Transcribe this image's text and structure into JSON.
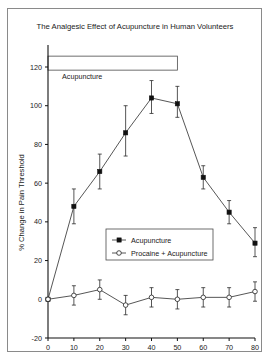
{
  "chart_data": {
    "type": "line",
    "title": "The Analgesic Effect of Acupuncture in Human Volunteers",
    "xlabel": "Time (minutes)",
    "ylabel": "% Change in Pain Threshold",
    "x": [
      0,
      10,
      20,
      30,
      40,
      50,
      60,
      70,
      80
    ],
    "xlim": [
      0,
      80
    ],
    "ylim": [
      -20,
      120
    ],
    "xticks": [
      0,
      10,
      20,
      30,
      40,
      50,
      60,
      70,
      80
    ],
    "yticks": [
      -20,
      0,
      20,
      40,
      60,
      80,
      100,
      120
    ],
    "grid": false,
    "legend_position": "center",
    "series": [
      {
        "name": "Acupuncture",
        "marker": "filled-square",
        "linestyle": "solid",
        "values": [
          0,
          48,
          66,
          86,
          104,
          101,
          63,
          45,
          29
        ],
        "error_low": [
          0,
          39,
          57,
          74,
          96,
          94,
          57,
          39,
          22
        ],
        "error_high": [
          0,
          57,
          75,
          100,
          113,
          110,
          69,
          51,
          37
        ]
      },
      {
        "name": "Procaine + Acupuncture",
        "marker": "open-circle",
        "linestyle": "solid",
        "values": [
          0,
          2,
          5,
          -3,
          1,
          0,
          1,
          1,
          4
        ],
        "error_low": [
          0,
          -3,
          0,
          -8,
          -4,
          -5,
          -4,
          -4,
          -1
        ],
        "error_high": [
          0,
          7,
          10,
          2,
          6,
          5,
          6,
          6,
          9
        ]
      }
    ],
    "annotations": [
      {
        "kind": "span-bar",
        "label": "Acupuncture",
        "x_start": 0,
        "x_end": 50,
        "y_level": 122
      }
    ]
  }
}
